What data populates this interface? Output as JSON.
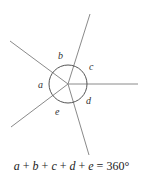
{
  "diagram": {
    "center": {
      "x": 68,
      "y": 84
    },
    "circle_radius": 19,
    "rays": [
      {
        "name": "ray-top",
        "x2": 90,
        "y2": 14
      },
      {
        "name": "ray-right",
        "x2": 138,
        "y2": 84
      },
      {
        "name": "ray-bottom",
        "x2": 89,
        "y2": 155
      },
      {
        "name": "ray-lower-left",
        "x2": 11,
        "y2": 127
      },
      {
        "name": "ray-upper-left",
        "x2": 10,
        "y2": 41
      }
    ],
    "angle_labels": [
      {
        "text": "a",
        "x": 38,
        "y": 88
      },
      {
        "text": "b",
        "x": 58,
        "y": 59
      },
      {
        "text": "c",
        "x": 89,
        "y": 70
      },
      {
        "text": "d",
        "x": 86,
        "y": 104
      },
      {
        "text": "e",
        "x": 55,
        "y": 115
      }
    ]
  },
  "equation": {
    "a": "a",
    "b": "b",
    "c": "c",
    "d": "d",
    "e": "e",
    "plus": " + ",
    "equals": " = ",
    "total": "360°"
  }
}
